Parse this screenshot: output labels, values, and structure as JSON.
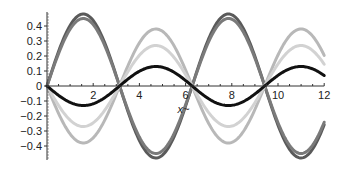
{
  "chart_data": {
    "type": "line",
    "title": "",
    "xlabel": "x",
    "ylabel": "",
    "xlim": [
      0,
      12
    ],
    "ylim": [
      -0.5,
      0.5
    ],
    "x_ticks": [
      2,
      4,
      6,
      8,
      10,
      12
    ],
    "y_ticks": [
      -0.4,
      -0.3,
      -0.2,
      -0.1,
      0,
      0.1,
      0.2,
      0.3,
      0.4
    ],
    "y_tick_labels": [
      "-0.4",
      "-0.3",
      "-0.2",
      "-0.1",
      "0",
      "0.1",
      "0.2",
      "0.3",
      "0.4"
    ],
    "grid": false,
    "legend": "none",
    "series": [
      {
        "name": "curve-1",
        "function": "0.48*sin(x)",
        "amplitude": 0.48,
        "color": "#5a5a5a"
      },
      {
        "name": "curve-2",
        "function": "0.45*sin(x)",
        "amplitude": 0.45,
        "color": "#7a7a7a"
      },
      {
        "name": "curve-3",
        "function": "-0.38*sin(x)",
        "amplitude": -0.38,
        "color": "#b8b8b8"
      },
      {
        "name": "curve-4",
        "function": "-0.27*sin(x)",
        "amplitude": -0.27,
        "color": "#d2d2d2"
      },
      {
        "name": "curve-5",
        "function": "-0.13*sin(x)",
        "amplitude": -0.13,
        "color": "#111111"
      }
    ]
  },
  "layout": {
    "origin_px": [
      47,
      86
    ],
    "px_per_x": 23.1,
    "px_per_y": 150,
    "y_axis_top": 12,
    "y_axis_bottom": 160
  }
}
